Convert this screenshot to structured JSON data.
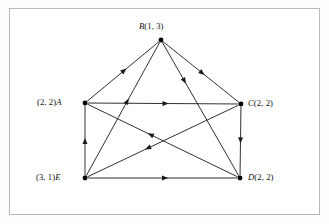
{
  "figure": {
    "type": "directed-graph",
    "background_color": "#ffffff",
    "frame_color": "#b9b9b9",
    "edge_color": "#1a1a1a",
    "vertex_color": "#000000"
  },
  "vertices": [
    {
      "id": "B",
      "name": "B",
      "coord": "(1, 3)",
      "label": "B (1, 3)",
      "label_side": "above",
      "x": 161,
      "y": 40
    },
    {
      "id": "A",
      "name": "A",
      "coord": "(2, 2)",
      "label": "(2, 2) A",
      "label_side": "left",
      "x": 85,
      "y": 103
    },
    {
      "id": "C",
      "name": "C",
      "coord": "(2, 2)",
      "label": "C (2, 2)",
      "label_side": "right",
      "x": 241,
      "y": 104
    },
    {
      "id": "E",
      "name": "E",
      "coord": "(3, 1)",
      "label": "(3, 1) E",
      "label_side": "left",
      "x": 85,
      "y": 178
    },
    {
      "id": "D",
      "name": "D",
      "coord": "(2, 2)",
      "label": "D (2, 2)",
      "label_side": "right",
      "x": 240,
      "y": 178
    }
  ],
  "edges": [
    {
      "from": "A",
      "to": "B",
      "arrow_t": 0.52
    },
    {
      "from": "E",
      "to": "B",
      "arrow_t": 0.56
    },
    {
      "from": "B",
      "to": "C",
      "arrow_t": 0.52
    },
    {
      "from": "B",
      "to": "D",
      "arrow_t": 0.3
    },
    {
      "from": "A",
      "to": "C",
      "arrow_t": 0.52
    },
    {
      "from": "E",
      "to": "A",
      "arrow_t": 0.5
    },
    {
      "from": "C",
      "to": "D",
      "arrow_t": 0.5
    },
    {
      "from": "E",
      "to": "D",
      "arrow_t": 0.52
    },
    {
      "from": "D",
      "to": "A",
      "arrow_t": 0.58
    },
    {
      "from": "C",
      "to": "E",
      "arrow_t": 0.6
    }
  ]
}
